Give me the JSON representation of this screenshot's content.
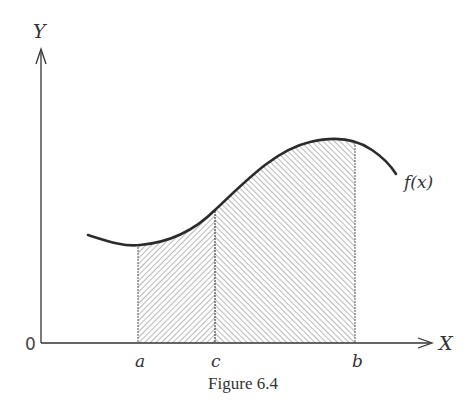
{
  "figure": {
    "caption": "Figure 6.4",
    "axes": {
      "x_label": "X",
      "y_label": "Y",
      "origin_label": "0"
    },
    "points": {
      "a_label": "a",
      "c_label": "c",
      "b_label": "b"
    },
    "curve_label": "f(x)",
    "regions": [
      {
        "name": "region-a-to-c",
        "from": "a",
        "to": "c",
        "hatch": "forward-slash"
      },
      {
        "name": "region-c-to-b",
        "from": "c",
        "to": "b",
        "hatch": "back-slash"
      }
    ],
    "colors": {
      "ink": "#2b2b2b",
      "hatch": "#8a8a8a",
      "background": "#ffffff"
    }
  }
}
